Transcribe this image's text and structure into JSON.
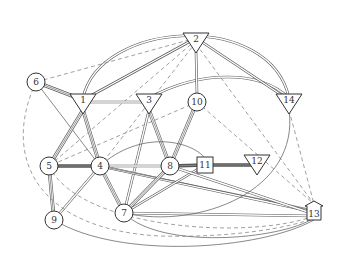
{
  "diagram": {
    "type": "network-graph",
    "colors": {
      "background": "#ffffff",
      "stroke": "#555555",
      "node_stroke": "#333333",
      "dashed": "#777777"
    },
    "nodes": [
      {
        "id": "1",
        "label": "1",
        "shape": "triangle",
        "x": 83,
        "y": 102
      },
      {
        "id": "2",
        "label": "2",
        "shape": "triangle",
        "x": 196,
        "y": 41
      },
      {
        "id": "3",
        "label": "3",
        "shape": "triangle",
        "x": 149,
        "y": 102
      },
      {
        "id": "4",
        "label": "4",
        "shape": "circle",
        "x": 100,
        "y": 166
      },
      {
        "id": "5",
        "label": "5",
        "shape": "circle",
        "x": 49,
        "y": 166
      },
      {
        "id": "6",
        "label": "6",
        "shape": "circle",
        "x": 36,
        "y": 82
      },
      {
        "id": "7",
        "label": "7",
        "shape": "circle",
        "x": 124,
        "y": 213
      },
      {
        "id": "8",
        "label": "8",
        "shape": "circle",
        "x": 170,
        "y": 166
      },
      {
        "id": "9",
        "label": "9",
        "shape": "circle",
        "x": 54,
        "y": 220
      },
      {
        "id": "10",
        "label": "10",
        "shape": "circle",
        "x": 197,
        "y": 102
      },
      {
        "id": "11",
        "label": "11",
        "shape": "square",
        "x": 205,
        "y": 165
      },
      {
        "id": "12",
        "label": "12",
        "shape": "triangle",
        "x": 257,
        "y": 163
      },
      {
        "id": "13",
        "label": "13",
        "shape": "house",
        "x": 314,
        "y": 212
      },
      {
        "id": "14",
        "label": "14",
        "shape": "triangle",
        "x": 289,
        "y": 102
      }
    ],
    "edges": [
      {
        "d": "M83,98 C100,20 270,10 289,98",
        "style": "double"
      },
      {
        "d": "M149,98 C200,70 260,70 289,98",
        "style": "double"
      },
      {
        "d": "M196,38 L83,100",
        "style": "double"
      },
      {
        "d": "M196,38 L289,100",
        "style": "double"
      },
      {
        "d": "M196,52 L197,94",
        "style": "double"
      },
      {
        "d": "M196,38 L36,82",
        "style": "dashed"
      },
      {
        "d": "M196,40 L49,166",
        "style": "dashed"
      },
      {
        "d": "M196,42 L100,166",
        "style": "dashed"
      },
      {
        "d": "M196,44 L314,204",
        "style": "dashed"
      },
      {
        "d": "M197,102 L314,204",
        "style": "dashed"
      },
      {
        "d": "M197,102 L49,166",
        "style": "dashed"
      },
      {
        "d": "M36,82 L83,100",
        "style": "triple"
      },
      {
        "d": "M36,82 L100,166",
        "style": "single"
      },
      {
        "d": "M83,102 L149,102",
        "style": "double"
      },
      {
        "d": "M83,110 L49,166",
        "style": "triple"
      },
      {
        "d": "M83,110 L100,166",
        "style": "triple"
      },
      {
        "d": "M149,110 L170,166",
        "style": "triple"
      },
      {
        "d": "M149,110 L124,213",
        "style": "double"
      },
      {
        "d": "M197,102 L170,166",
        "style": "triple"
      },
      {
        "d": "M49,166 L100,166",
        "style": "thick"
      },
      {
        "d": "M49,166 L54,220",
        "style": "triple"
      },
      {
        "d": "M100,166 L54,220",
        "style": "double"
      },
      {
        "d": "M100,166 L124,213",
        "style": "triple"
      },
      {
        "d": "M100,166 L170,166",
        "style": "double"
      },
      {
        "d": "M100,166 C140,130 190,140 205,158",
        "style": "single"
      },
      {
        "d": "M100,166 L314,212",
        "style": "double"
      },
      {
        "d": "M100,166 L314,210",
        "style": "single"
      },
      {
        "d": "M170,166 L124,213",
        "style": "triple"
      },
      {
        "d": "M170,166 L205,165",
        "style": "thick"
      },
      {
        "d": "M205,165 L257,165",
        "style": "thick"
      },
      {
        "d": "M205,165 L124,213",
        "style": "double"
      },
      {
        "d": "M170,166 L314,214",
        "style": "double"
      },
      {
        "d": "M124,213 L314,216",
        "style": "double"
      },
      {
        "d": "M124,213 C160,250 280,240 314,218",
        "style": "single"
      },
      {
        "d": "M289,110 C300,190 200,230 124,213",
        "style": "single"
      },
      {
        "d": "M54,220 C120,260 260,250 314,220",
        "style": "single"
      },
      {
        "d": "M49,166 C80,230 250,240 314,216",
        "style": "dashed"
      },
      {
        "d": "M36,82 C0,160 40,230 160,236 C230,238 290,228 314,218",
        "style": "dashed"
      },
      {
        "d": "M289,110 L314,204",
        "style": "dashed"
      }
    ]
  }
}
